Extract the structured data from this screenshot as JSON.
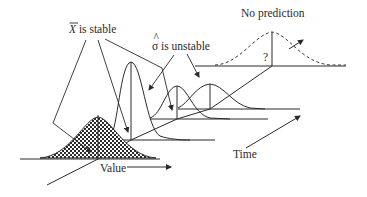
{
  "diagram": {
    "type": "process-distribution-over-time",
    "labels": {
      "mean_stable": "X̄ is stable",
      "mean_symbol": "X",
      "mean_suffix": " is stable",
      "sigma_unstable": "σ̂ is unstable",
      "sigma_symbol": "σ",
      "sigma_suffix": " is unstable",
      "no_prediction": "No prediction",
      "question_mark": "?",
      "value_axis": "Value",
      "time_axis": "Time"
    },
    "distributions": [
      {
        "name": "t1",
        "style": "hatched",
        "peak_height": "medium",
        "width": "medium"
      },
      {
        "name": "t2",
        "style": "solid",
        "peak_height": "tall",
        "width": "narrow"
      },
      {
        "name": "t3",
        "style": "solid",
        "peak_height": "short",
        "width": "wide"
      },
      {
        "name": "t4",
        "style": "solid",
        "peak_height": "short",
        "width": "wide"
      },
      {
        "name": "t5",
        "style": "dashed",
        "peak_height": "medium",
        "width": "wide",
        "note": "unknown"
      }
    ],
    "colors": {
      "ink": "#2a2a2a",
      "background": "#ffffff"
    }
  }
}
